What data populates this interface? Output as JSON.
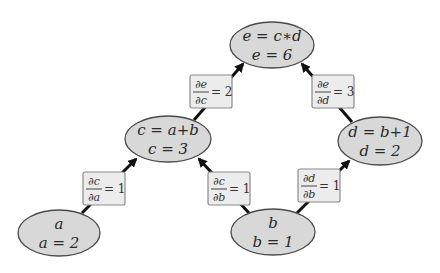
{
  "diagram": {
    "type": "computational-graph",
    "colors": {
      "node_fill": "#d8d8d8",
      "node_stroke": "#4a4a4a",
      "label_fill": "#ececec",
      "label_stroke": "#8a8a8a",
      "edge": "#111111"
    },
    "nodes": [
      {
        "id": "e",
        "expr": "e = c∗d",
        "value": "e = 6",
        "cx": 272,
        "cy": 45,
        "rx": 42,
        "ry": 23
      },
      {
        "id": "c",
        "expr": "c = a+b",
        "value": "c = 3",
        "cx": 168,
        "cy": 139,
        "rx": 43,
        "ry": 23
      },
      {
        "id": "d",
        "expr": "d = b+1",
        "value": "d = 2",
        "cx": 380,
        "cy": 141,
        "rx": 42,
        "ry": 24
      },
      {
        "id": "a",
        "expr": "a",
        "value": "a = 2",
        "cx": 59,
        "cy": 233,
        "rx": 41,
        "ry": 23
      },
      {
        "id": "b",
        "expr": "b",
        "value": "b = 1",
        "cx": 273,
        "cy": 232,
        "rx": 42,
        "ry": 23
      }
    ],
    "edges": [
      {
        "from": "c",
        "to": "e",
        "numerator": "∂e",
        "denominator": "∂c",
        "value": "= 2"
      },
      {
        "from": "d",
        "to": "e",
        "numerator": "∂e",
        "denominator": "∂d",
        "value": "= 3"
      },
      {
        "from": "a",
        "to": "c",
        "numerator": "∂c",
        "denominator": "∂a",
        "value": "= 1"
      },
      {
        "from": "b",
        "to": "c",
        "numerator": "∂c",
        "denominator": "∂b",
        "value": "= 1"
      },
      {
        "from": "b",
        "to": "d",
        "numerator": "∂d",
        "denominator": "∂b",
        "value": "= 1"
      }
    ]
  }
}
